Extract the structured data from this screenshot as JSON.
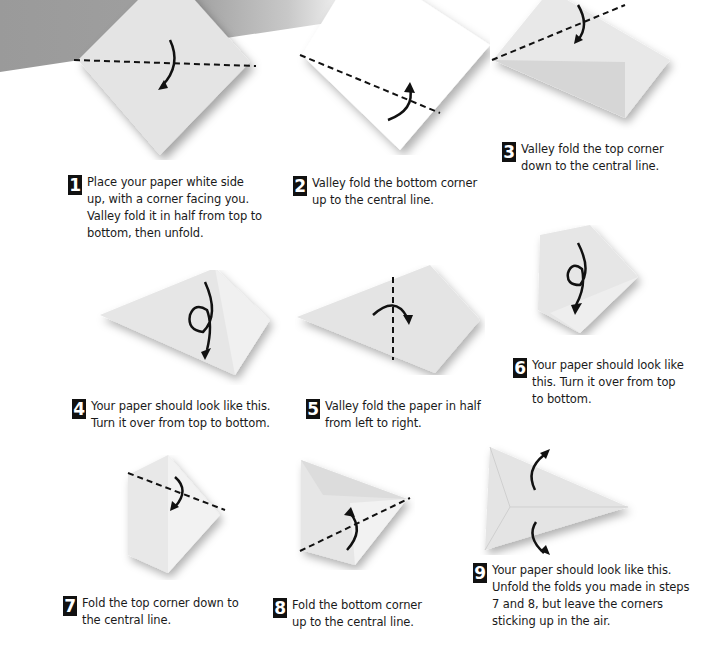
{
  "colors": {
    "banner": "#9a9a9a",
    "paper": "#e6e6e6",
    "ink": "#111111"
  },
  "steps": [
    {
      "number": "1",
      "text": "Place your paper white side\nup, with a corner facing you.\nValley fold it in half from top to\nbottom, then unfold."
    },
    {
      "number": "2",
      "text": "Valley fold the bottom corner\nup to the central line."
    },
    {
      "number": "3",
      "text": "Valley fold the top corner\ndown to the central line."
    },
    {
      "number": "4",
      "text": "Your paper should look like this.\nTurn it over from top to bottom."
    },
    {
      "number": "5",
      "text": "Valley fold the paper in half\nfrom left to right."
    },
    {
      "number": "6",
      "text": "Your paper should look like\nthis. Turn it over from top\nto bottom."
    },
    {
      "number": "7",
      "text": "Fold the top corner down to\nthe central line."
    },
    {
      "number": "8",
      "text": "Fold the bottom corner\nup to the central line."
    },
    {
      "number": "9",
      "text": "Your paper should look like this.\nUnfold the folds you made in steps\n7 and 8, but leave the corners\nsticking up in the air."
    }
  ]
}
